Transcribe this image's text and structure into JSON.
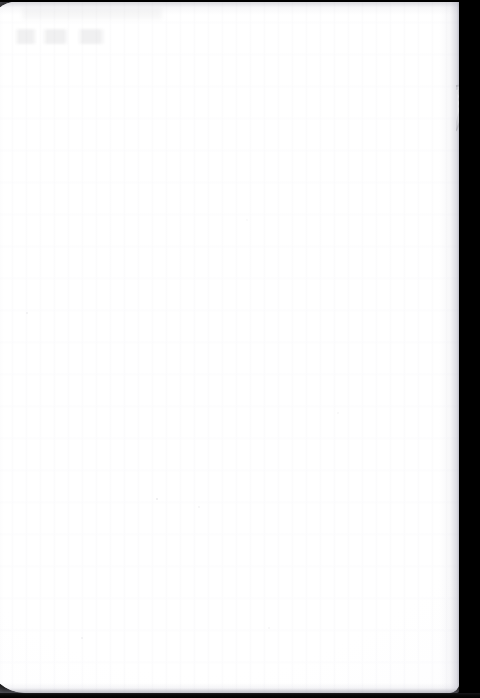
{
  "document": {
    "kind": "scanned-page",
    "title": "Blank scanned page",
    "page_side": "recto",
    "content_text": "",
    "visible_text_lines": [],
    "notes": "No printed or handwritten text is legible on this page; the surface is blank."
  },
  "canvas": {
    "width_px": 480,
    "height_px": 698,
    "background_color": "#000000"
  },
  "paper": {
    "label": "page-surface",
    "color": "#ffffff",
    "edge_shadow_color": "#96969e",
    "left_px": -14,
    "top_px": 1,
    "width_px": 473,
    "height_px": 692,
    "corner_radius_top_left_px": 34,
    "corner_radius_top_right_px": 3,
    "corner_radius_bottom_left_px": 40,
    "corner_radius_bottom_right_px": 10
  },
  "artifacts": {
    "ghost_marks": {
      "label": "bleed-through ghost marks",
      "description": "Very faint show-through of ink from the reverse side of the sheet, upper-left area.",
      "color": "#6c6c76",
      "opacity": 0.105,
      "left_px": 14,
      "top_px": 19,
      "width_px": 112,
      "height_px": 30
    },
    "torn_tab": {
      "label": "torn paper tab",
      "description": "Small irregular light-grey flap of paper protruding past the right edge of the sheet.",
      "color": "#b9b9bf",
      "left_px": 456,
      "top_px": 84,
      "width_px": 15,
      "height_px": 48
    },
    "speckle": {
      "label": "scanner dust speckle",
      "color": "#b4b4bc"
    },
    "banding": {
      "label": "scanner banding",
      "color": "#f2f2f6"
    }
  },
  "bezel": {
    "right": {
      "label": "scanner bezel right",
      "color": "#000000",
      "width_px": 21
    },
    "bottom": {
      "label": "scanner bezel bottom",
      "color": "#000000",
      "height_px": 5
    },
    "top": {
      "label": "scanner bezel top",
      "color": "#000000",
      "height_px": 2
    }
  }
}
